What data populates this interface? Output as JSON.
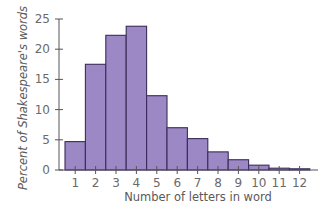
{
  "chart_data": {
    "type": "bar",
    "title": "",
    "xlabel": "Number of letters in word",
    "ylabel": "Percent of Shakespeare's words",
    "categories": [
      "1",
      "2",
      "3",
      "4",
      "5",
      "6",
      "7",
      "8",
      "9",
      "10",
      "11",
      "12"
    ],
    "values": [
      4.7,
      17.5,
      22.3,
      23.8,
      12.3,
      7.0,
      5.2,
      3.0,
      1.7,
      0.8,
      0.3,
      0.2
    ],
    "ylim": [
      0,
      25
    ],
    "yticks": [
      0,
      5,
      10,
      15,
      20,
      25
    ],
    "grid": false,
    "legend": null,
    "bar_gap": 0
  },
  "colors": {
    "bar_fill": "#9b88c4",
    "bar_stroke": "#3a2d5a",
    "axis": "#555555",
    "text": "#666666"
  }
}
